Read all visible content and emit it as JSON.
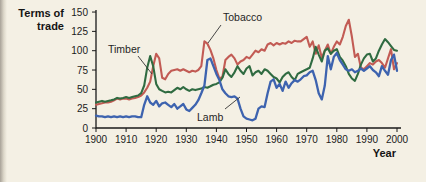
{
  "page": {
    "background_color": "#f4f0e4",
    "edge_color": "#a8a298"
  },
  "chart_data": {
    "type": "line",
    "y_axis_title_line1": "Terms of",
    "y_axis_title_line2": "trade",
    "x_axis_title": "Year",
    "x_range": [
      1900,
      2000
    ],
    "x_step": 1,
    "y_range": [
      0,
      150
    ],
    "x_ticks": [
      1900,
      1910,
      1920,
      1930,
      1940,
      1950,
      1960,
      1970,
      1980,
      1990,
      2000
    ],
    "y_ticks": [
      0,
      25,
      50,
      75,
      100,
      125,
      150
    ],
    "grid": false,
    "legend": "inline-labels",
    "axis_color": "#1a1a1a",
    "series": [
      {
        "name": "Tobacco",
        "color": "#c25b54",
        "values": [
          30,
          31,
          32,
          33,
          33,
          34,
          36,
          38,
          37,
          38,
          38,
          37,
          38,
          39,
          40,
          42,
          46,
          52,
          60,
          80,
          96,
          90,
          65,
          63,
          70,
          74,
          75,
          76,
          74,
          76,
          74,
          72,
          74,
          73,
          75,
          80,
          112,
          109,
          101,
          90,
          75,
          64,
          66,
          88,
          92,
          95,
          90,
          82,
          86,
          88,
          92,
          90,
          95,
          100,
          98,
          102,
          100,
          108,
          110,
          107,
          110,
          108,
          110,
          109,
          112,
          110,
          113,
          112,
          112,
          115,
          118,
          105,
          112,
          96,
          107,
          91,
          100,
          108,
          96,
          105,
          112,
          108,
          118,
          132,
          140,
          118,
          92,
          96,
          78,
          76,
          80,
          84,
          82,
          86,
          88,
          84,
          78,
          90,
          102,
          76,
          84
        ]
      },
      {
        "name": "Timber",
        "color": "#2f6b41",
        "values": [
          33,
          34,
          35,
          34,
          35,
          36,
          37,
          39,
          38,
          39,
          40,
          39,
          40,
          41,
          42,
          45,
          55,
          78,
          93,
          80,
          57,
          50,
          48,
          46,
          47,
          46,
          49,
          52,
          50,
          53,
          50,
          48,
          50,
          49,
          50,
          51,
          53,
          52,
          54,
          56,
          57,
          59,
          65,
          76,
          70,
          66,
          72,
          80,
          74,
          70,
          77,
          80,
          68,
          72,
          74,
          70,
          76,
          74,
          70,
          66,
          64,
          59,
          66,
          70,
          72,
          66,
          62,
          70,
          72,
          74,
          76,
          78,
          90,
          105,
          95,
          86,
          100,
          103,
          96,
          100,
          102,
          92,
          87,
          80,
          70,
          64,
          61,
          70,
          82,
          90,
          95,
          96,
          86,
          90,
          100,
          108,
          115,
          111,
          106,
          101,
          100
        ]
      },
      {
        "name": "Lamb",
        "color": "#3d63af",
        "values": [
          16,
          15,
          15,
          14,
          15,
          14,
          15,
          14,
          15,
          14,
          15,
          14,
          15,
          15,
          14,
          14,
          30,
          41,
          33,
          30,
          35,
          28,
          32,
          33,
          30,
          27,
          31,
          25,
          28,
          31,
          24,
          22,
          26,
          30,
          36,
          45,
          55,
          88,
          90,
          80,
          70,
          62,
          50,
          45,
          41,
          40,
          41,
          38,
          25,
          15,
          12,
          11,
          10,
          12,
          25,
          28,
          27,
          45,
          60,
          63,
          52,
          57,
          48,
          60,
          52,
          58,
          62,
          60,
          63,
          67,
          68,
          72,
          74,
          62,
          45,
          37,
          55,
          93,
          76,
          92,
          97,
          88,
          82,
          76,
          74,
          76,
          72,
          74,
          77,
          74,
          77,
          80,
          75,
          72,
          67,
          80,
          74,
          69,
          88,
          95,
          74
        ]
      }
    ],
    "annotations": [
      {
        "text": "Timber",
        "x": 108,
        "y": 53,
        "anchor": "start",
        "leader": [
          138,
          56,
          152,
          74
        ]
      },
      {
        "text": "Tobacco",
        "x": 223,
        "y": 21,
        "anchor": "start",
        "leader": [
          221,
          25,
          208,
          43
        ]
      },
      {
        "text": "Lamb",
        "x": 197,
        "y": 121,
        "anchor": "start",
        "leader": [
          225,
          109,
          240,
          97
        ]
      }
    ],
    "axis_layout": {
      "x0": 96,
      "y0": 128,
      "x_scale": 3.01,
      "y_scale": 0.773,
      "y_top": 10,
      "x_end": 401
    }
  }
}
